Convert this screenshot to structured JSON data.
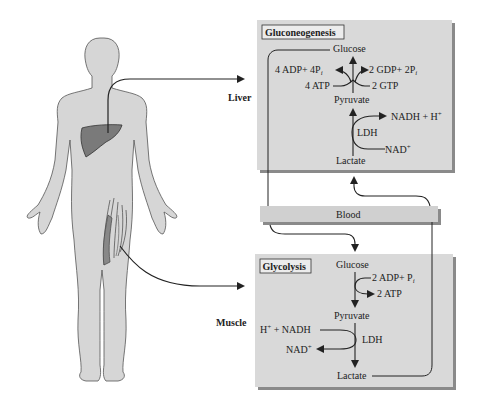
{
  "labels": {
    "liver": "Liver",
    "muscle": "Muscle",
    "blood": "Blood"
  },
  "gluconeogenesis": {
    "title": "Gluconeogenesis",
    "glucose": "Glucose",
    "adp_left": "4 ADP+ 4P",
    "adp_left_sub": "i",
    "gdp_right": "2 GDP+ 2P",
    "gdp_right_sub": "i",
    "atp": "4 ATP",
    "gtp": "2 GTP",
    "pyruvate": "Pyruvate",
    "nadh": "NADH + H",
    "nadh_sup": "+",
    "ldh": "LDH",
    "nad": "NAD",
    "nad_sup": "+",
    "lactate": "Lactate"
  },
  "glycolysis": {
    "title": "Glycolysis",
    "glucose": "Glucose",
    "adp": "2 ADP+ P",
    "adp_sub": "i",
    "atp": "2 ATP",
    "pyruvate": "Pyruvate",
    "h": "H",
    "h_sup": "+",
    "nadh": " + NADH",
    "ldh": "LDH",
    "nad": "NAD",
    "nad_sup": "+",
    "lactate": "Lactate"
  },
  "colors": {
    "box_fill": "#d9d9d9",
    "box_shadow": "#8a8a8a",
    "body_fill": "#d6d6d6",
    "liver_fill": "#7a7a7a",
    "line": "#222222"
  }
}
